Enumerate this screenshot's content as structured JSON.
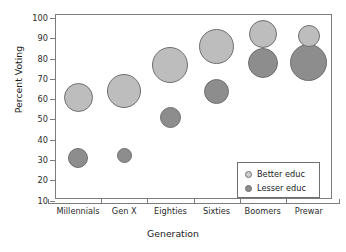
{
  "chart_data": {
    "type": "scatter",
    "title": "",
    "xlabel": "Generation",
    "ylabel": "Percent Voting",
    "categories": [
      "Millennials",
      "Gen X",
      "Eighties",
      "Sixties",
      "Boomers",
      "Prewar"
    ],
    "yticks": [
      10,
      20,
      30,
      40,
      50,
      60,
      70,
      80,
      90,
      100
    ],
    "ylim": [
      0,
      100
    ],
    "grid": false,
    "legend_position": "bottom-right",
    "note": "Bubble area encodes relative group size",
    "series": [
      {
        "name": "Better educ",
        "color": "#bdbdbd",
        "values": [
          61,
          64,
          77,
          86,
          92,
          91
        ],
        "sizes": [
          29,
          34,
          36,
          35,
          28,
          22
        ]
      },
      {
        "name": "Lesser educ",
        "color": "#8d8d8d",
        "values": [
          31,
          32,
          51,
          64,
          78,
          78
        ],
        "sizes": [
          20,
          15,
          21,
          25,
          30,
          37
        ]
      }
    ]
  },
  "axes": {
    "y_title": "Percent Voting",
    "x_title": "Generation",
    "y_tick_labels": [
      "100",
      "90",
      "80",
      "70",
      "60",
      "50",
      "40",
      "30",
      "20",
      "10"
    ],
    "x_tick_labels": [
      "Millennials",
      "Gen X",
      "Eighties",
      "Sixties",
      "Boomers",
      "Prewar"
    ]
  },
  "legend": {
    "entries": [
      {
        "label": "Better educ",
        "swatch": "better-educ-swatch-icon"
      },
      {
        "label": "Lesser educ",
        "swatch": "lesser-educ-swatch-icon"
      }
    ]
  }
}
